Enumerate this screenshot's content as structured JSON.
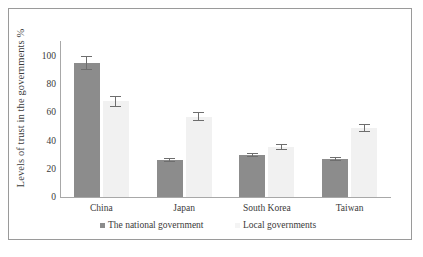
{
  "chart_data": {
    "type": "bar",
    "title": "",
    "subtitle": "",
    "xlabel": "",
    "ylabel": "Levels of trust in the governments %",
    "ylim": [
      0,
      110
    ],
    "yticks": [
      0,
      20,
      40,
      60,
      80,
      100
    ],
    "ytick_labels": [
      "0",
      "20",
      "40",
      "60",
      "80",
      "100"
    ],
    "grid": false,
    "legend_position": "bottom",
    "categories": [
      "China",
      "Japan",
      "South Korea",
      "Taiwan"
    ],
    "series": [
      {
        "name": "The national government",
        "color": "#8c8c8c",
        "values": [
          95,
          26,
          30,
          27
        ],
        "errors": [
          5,
          1.5,
          1.5,
          1.5
        ]
      },
      {
        "name": "Local governments",
        "color": "#f1f1f1",
        "values": [
          68,
          57,
          35.5,
          49
        ],
        "errors": [
          4,
          3,
          2,
          3
        ]
      }
    ]
  },
  "axis": {
    "y_title": "Levels of trust in the governments %"
  },
  "legend": {
    "items": [
      {
        "label": "The national government",
        "color": "#8c8c8c"
      },
      {
        "label": "Local governments",
        "color": "#f4f4f4"
      }
    ]
  },
  "colors": {
    "national": "#8c8c8c",
    "local": "#f1f1f1",
    "axis": "#a8a8a8",
    "error": "#6e6e6e",
    "frame": "#9a9a9a",
    "text": "#3a3a3a",
    "background": "#ffffff"
  }
}
